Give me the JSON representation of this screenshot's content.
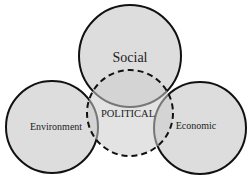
{
  "diagram": {
    "type": "venn",
    "circles": [
      {
        "id": "social",
        "label": "Social",
        "cx": 130,
        "cy": 56,
        "r": 51
      },
      {
        "id": "environment",
        "label": "Environment",
        "cx": 52,
        "cy": 127,
        "r": 46
      },
      {
        "id": "economic",
        "label": "Economic",
        "cx": 200,
        "cy": 128,
        "r": 46
      }
    ],
    "center": {
      "id": "political",
      "label": "POLITICAL",
      "cx": 130,
      "cy": 113,
      "r": 43,
      "style": "dashed"
    },
    "colors": {
      "fill": "#d9d9d9",
      "stroke": "#111111",
      "overlap": "#cfcfcf"
    }
  }
}
